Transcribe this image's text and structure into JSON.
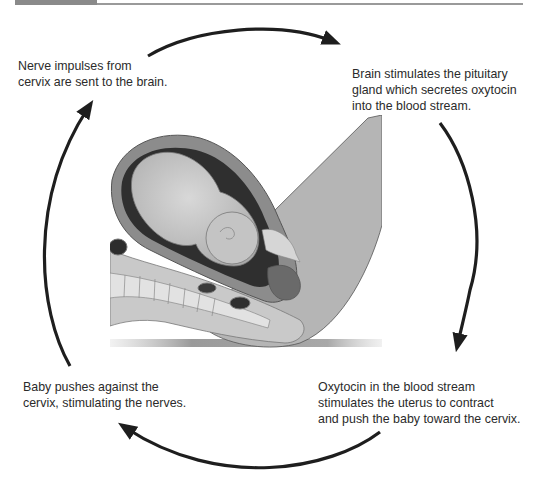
{
  "diagram": {
    "type": "cycle",
    "title": "",
    "steps": [
      {
        "id": 1,
        "position": "top-left",
        "text": "Nerve impulses from\ncervix are sent to the brain."
      },
      {
        "id": 2,
        "position": "top-right",
        "text": "Brain stimulates the pituitary\ngland which secretes oxytocin\ninto the blood stream."
      },
      {
        "id": 3,
        "position": "bottom-right",
        "text": "Oxytocin in the blood stream\nstimulates the uterus to contract\nand push the baby toward the cervix."
      },
      {
        "id": 4,
        "position": "bottom-left",
        "text": "Baby pushes against the\ncervix, stimulating the nerves."
      }
    ],
    "arrows": [
      {
        "from": "top-left",
        "to": "top-right",
        "direction": "clockwise"
      },
      {
        "from": "top-right",
        "to": "bottom-right",
        "direction": "clockwise"
      },
      {
        "from": "bottom-right",
        "to": "bottom-left",
        "direction": "clockwise"
      },
      {
        "from": "bottom-left",
        "to": "top-left",
        "direction": "clockwise"
      }
    ],
    "illustration": {
      "subject": "cross-section of pregnant uterus with fetus in head-down position during labor",
      "style": "grayscale anatomical illustration"
    }
  },
  "colors": {
    "arrow": "#1e1e1e",
    "text": "#2b2b2b",
    "header_bar": "#8a8a8a",
    "header_rule": "#9a9a9a"
  }
}
